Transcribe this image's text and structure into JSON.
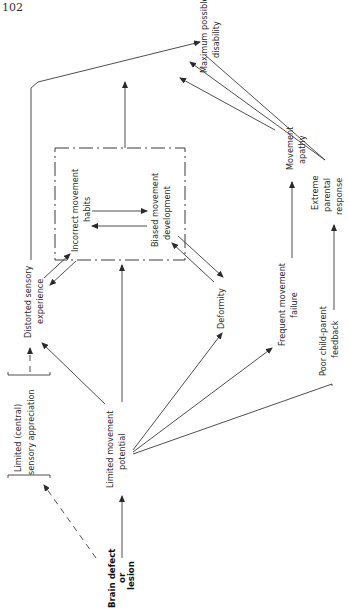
{
  "page_number": "102",
  "nodes": {
    "brain_defect": [
      "Brain defect",
      "or",
      "lesion"
    ],
    "limited_sensory": [
      "Limited (central)",
      "sensory appreciation"
    ],
    "limited_movement": [
      "Limited movement",
      "potential"
    ],
    "distorted_sensory": [
      "Distorted sensory",
      "experience"
    ],
    "incorrect_habits": [
      "Incorrect movement",
      "habits"
    ],
    "biased_development": [
      "Biased movement",
      "development"
    ],
    "deformity": [
      "Deformity"
    ],
    "frequent_failure": [
      "Frequent movement",
      "failure"
    ],
    "movement_apathy": [
      "Movement",
      "apathy"
    ],
    "poor_feedback": [
      "Poor child-parent",
      "feedback"
    ],
    "extreme_response": [
      "Extreme",
      "parental",
      "response"
    ],
    "max_disability": [
      "Maximum possible",
      "disability"
    ]
  },
  "edges": [
    {
      "from": "Brain defect or lesion",
      "to": "Limited (central) sensory appreciation",
      "style": "dashed"
    },
    {
      "from": "Brain defect or lesion",
      "to": "Limited movement potential",
      "style": "solid"
    },
    {
      "from": "Limited (central) sensory appreciation",
      "to": "Distorted sensory experience",
      "style": "dashed"
    },
    {
      "from": "Limited movement potential",
      "to": "Distorted sensory experience",
      "style": "solid"
    },
    {
      "from": "Limited movement potential",
      "to": "Biased movement development",
      "style": "solid"
    },
    {
      "from": "Limited movement potential",
      "to": "Deformity",
      "style": "solid"
    },
    {
      "from": "Limited movement potential",
      "to": "Frequent movement failure",
      "style": "solid"
    },
    {
      "from": "Limited movement potential",
      "to": "Poor child-parent feedback",
      "style": "solid"
    },
    {
      "from": "Distorted sensory experience",
      "to": "Incorrect movement habits",
      "style": "bidirectional"
    },
    {
      "from": "Incorrect movement habits",
      "to": "Biased movement development",
      "style": "bidirectional"
    },
    {
      "from": "Biased movement development",
      "to": "Deformity",
      "style": "bidirectional"
    },
    {
      "from": "Distorted sensory experience",
      "to": "Maximum possible disability",
      "style": "solid"
    },
    {
      "from": "Dash-dot box (habits/development)",
      "to": "Maximum possible disability",
      "style": "solid"
    },
    {
      "from": "Frequent movement failure",
      "to": "Movement apathy",
      "style": "solid"
    },
    {
      "from": "Movement apathy",
      "to": "Maximum possible disability",
      "style": "solid"
    },
    {
      "from": "Poor child-parent feedback",
      "to": "Extreme parental response",
      "style": "solid"
    },
    {
      "from": "Extreme parental response",
      "to": "Maximum possible disability",
      "style": "solid"
    }
  ]
}
